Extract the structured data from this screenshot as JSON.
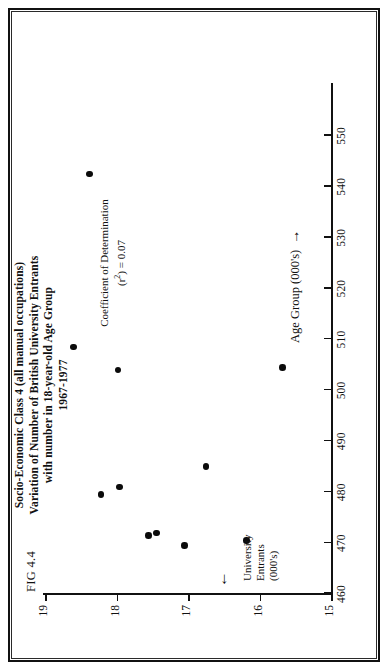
{
  "figure": {
    "number_label": "FIG 4.4",
    "title_lines": [
      "Socio-Economic Class 4 (all manual occupations)",
      "Variation of Number of British University Entrants",
      "with number in 18-year-old Age Group",
      "1967-1977"
    ],
    "annotation": {
      "line1": "Coefficient of Determination",
      "line2_prefix": "(r",
      "line2_sup": "2",
      "line2_suffix": ") = 0.07"
    },
    "y_axis_caption_lines": [
      "University",
      "Entrants",
      "(000's)"
    ],
    "y_axis_arrow": "←",
    "x_axis_caption": "Age Group (000's)",
    "x_axis_arrow": "→"
  },
  "chart_data": {
    "type": "scatter",
    "title": "Socio-Economic Class 4 (all manual occupations) Variation of Number of British University Entrants with number in 18-year-old Age Group 1967-1977",
    "xlabel": "Age Group (000's)",
    "ylabel": "University Entrants (000's)",
    "xlim": [
      460,
      560
    ],
    "ylim": [
      15,
      19
    ],
    "xticks": [
      460,
      470,
      480,
      490,
      500,
      510,
      520,
      530,
      540,
      550
    ],
    "yticks": [
      15,
      16,
      17,
      18,
      19
    ],
    "xtick_labels": [
      "460",
      "470",
      "480",
      "490",
      "500",
      "510",
      "520",
      "530",
      "540",
      "550"
    ],
    "ytick_labels": [
      "15",
      "16",
      "17",
      "18",
      "19"
    ],
    "grid": false,
    "legend": false,
    "annotations": [
      "Coefficient of Determination (r2) = 0.07"
    ],
    "r_squared": 0.07,
    "points": [
      {
        "x": 479.5,
        "y": 18.22
      },
      {
        "x": 481.0,
        "y": 17.96
      },
      {
        "x": 471.5,
        "y": 17.55
      },
      {
        "x": 472.0,
        "y": 17.44
      },
      {
        "x": 469.5,
        "y": 17.05
      },
      {
        "x": 485.0,
        "y": 16.75
      },
      {
        "x": 470.5,
        "y": 16.18
      },
      {
        "x": 508.5,
        "y": 18.6
      },
      {
        "x": 504.0,
        "y": 17.98
      },
      {
        "x": 504.5,
        "y": 15.68
      },
      {
        "x": 542.5,
        "y": 18.38
      }
    ]
  }
}
